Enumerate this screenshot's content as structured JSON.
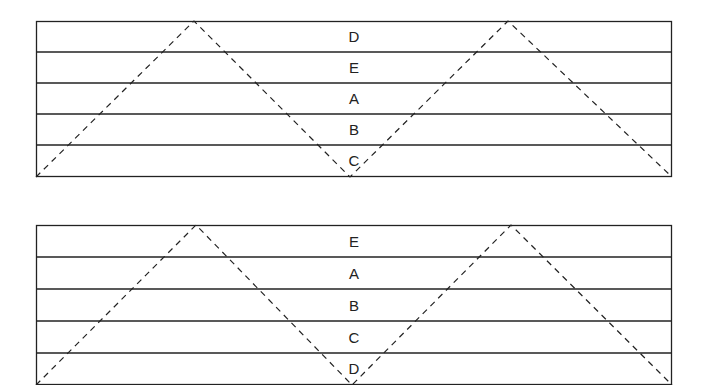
{
  "panels": [
    {
      "id": "top",
      "rows": [
        "D",
        "E",
        "A",
        "B",
        "C"
      ],
      "zigzag": "dashed triangle wave: peaks at 1/4 and 3/4 width, valleys at edges and center"
    },
    {
      "id": "bottom",
      "rows": [
        "E",
        "A",
        "B",
        "C",
        "D"
      ],
      "zigzag": "dashed triangle wave: peaks at 1/4 and 3/4 width, valleys at edges and center"
    }
  ],
  "colors": {
    "line": "#222222",
    "background": "#ffffff"
  }
}
